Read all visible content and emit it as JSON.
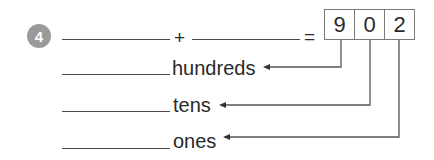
{
  "exercise": {
    "number": "4",
    "equation": {
      "plus_sign": "+",
      "equals_sign": "=",
      "blank_1": "",
      "blank_2": ""
    },
    "number_boxes": {
      "digits": [
        "9",
        "0",
        "2"
      ],
      "value": "902"
    },
    "place_values": [
      {
        "label": "hundreds",
        "answer": ""
      },
      {
        "label": "tens",
        "answer": ""
      },
      {
        "label": "ones",
        "answer": ""
      }
    ]
  },
  "colors": {
    "badge_background": "#9a9a9a",
    "text": "#2a2a2a",
    "lines": "#4a4a4a",
    "box_border": "#7a7a7a"
  }
}
